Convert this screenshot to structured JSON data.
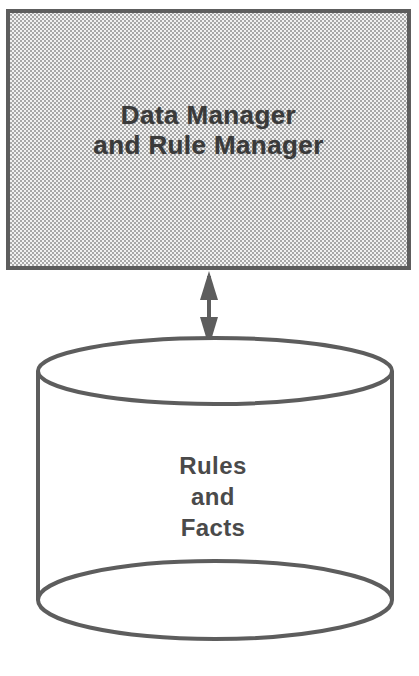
{
  "diagram": {
    "background_color": "#ffffff",
    "stroke_color": "#595959",
    "text_color": "#3a3a3a",
    "fill_pattern": "50-percent-checkerboard-dither",
    "fill_pattern_colors": [
      "#b4b4b4",
      "#efefef"
    ],
    "nodes": [
      {
        "id": "manager-box",
        "shape": "rectangle",
        "label": "Data Manager\nand Rule Manager",
        "line1": "Data Manager",
        "line2": "and Rule Manager",
        "fill": "dithered-gray",
        "x": 6,
        "y": 9,
        "width": 405,
        "height": 261
      },
      {
        "id": "data-store-cylinder",
        "shape": "cylinder",
        "label": "Rules\nand\nFacts",
        "line1": "Rules",
        "line2": "and",
        "line3": "Facts",
        "fill": "white",
        "x": 36,
        "y": 338,
        "width": 354,
        "height": 300
      }
    ],
    "connectors": [
      {
        "id": "manager-store-link",
        "type": "double-headed-arrow",
        "orientation": "vertical",
        "from": "manager-box",
        "to": "data-store-cylinder",
        "x": 209,
        "y_start": 271,
        "y_end": 345
      }
    ]
  }
}
